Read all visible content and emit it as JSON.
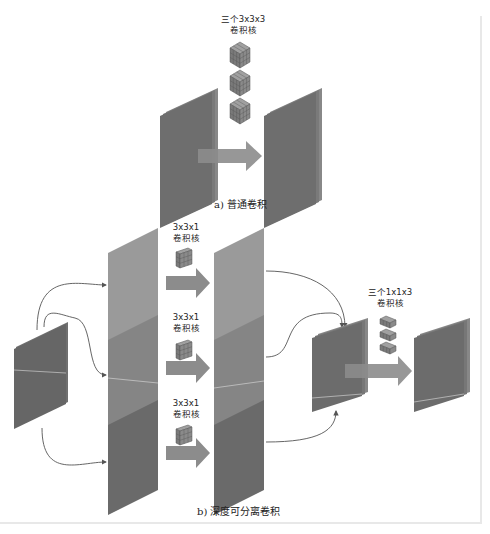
{
  "diagram": {
    "part_a": {
      "kernel_label_line1": "三个3x3x3",
      "kernel_label_line2": "卷积核",
      "caption": "a) 普通卷积"
    },
    "part_b": {
      "branches": [
        {
          "kernel_label_line1": "3x3x1",
          "kernel_label_line2": "卷积核"
        },
        {
          "kernel_label_line1": "3x3x1",
          "kernel_label_line2": "卷积核"
        },
        {
          "kernel_label_line1": "3x3x1",
          "kernel_label_line2": "卷积核"
        }
      ],
      "pointwise_label_line1": "三个1x1x3",
      "pointwise_label_line2": "卷积核",
      "caption": "b) 深度可分离卷积"
    },
    "colors": {
      "sheet_light": "#9a9a9a",
      "sheet_mid": "#7e7e7e",
      "sheet_dark": "#666666",
      "stack": "#6a6a6a",
      "arrow": "#8c8c8c",
      "curve": "#555555"
    }
  }
}
